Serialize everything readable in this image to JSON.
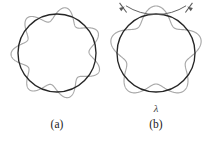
{
  "figure": {
    "background_color": "#ffffff",
    "orbit_color": "#262626",
    "wave_color": "#a8a8a8",
    "annotation_color": "#5a5a5a",
    "caption_color": "#1a1a1a"
  },
  "panels": [
    {
      "id": "a",
      "caption": "(a)",
      "center_x": 57,
      "center_y": 53,
      "orbit_radius": 39,
      "wave_amplitude": 7,
      "wave_cycles": 7,
      "phase_deg": 12,
      "has_wavelength_marker": false
    },
    {
      "id": "b",
      "caption": "(b)",
      "center_x": 156,
      "center_y": 53,
      "orbit_radius": 39,
      "wave_amplitude": 8,
      "wave_cycles": 5,
      "phase_deg": 90,
      "has_wavelength_marker": true
    }
  ],
  "wavelength_marker": {
    "symbol": "λ",
    "label_x": 156,
    "label_y": 112,
    "arc_center_x": 156,
    "arc_center_y": 53,
    "arc_radius": 56,
    "start_angle_deg": 234,
    "end_angle_deg": 306,
    "tick_inner_radius": 50,
    "tick_outer_radius": 62
  },
  "captions": {
    "a_x": 57,
    "a_y": 128,
    "b_x": 156,
    "b_y": 128
  }
}
